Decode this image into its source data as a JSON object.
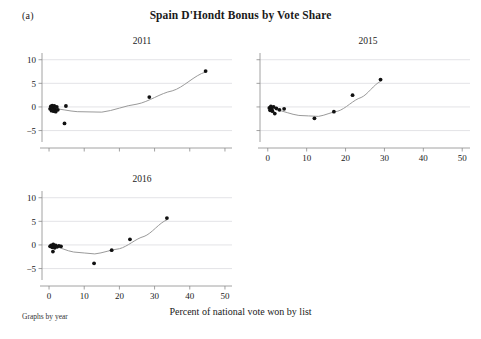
{
  "figure": {
    "letter": "(a)",
    "title": "Spain D'Hondt Bonus by Vote Share",
    "x_axis_title": "Percent of national vote won by list",
    "footnote": "Graphs by year"
  },
  "chart_data": {
    "type": "scatter",
    "title": "Spain D'Hondt Bonus by Vote Share",
    "xlabel": "Percent of national vote won by list",
    "ylabel": "",
    "xlim": [
      -2,
      52
    ],
    "ylim": [
      -7,
      11
    ],
    "grid": true,
    "legend": "none",
    "layout": "3 panels, small multiples by year (2011, 2015 top row; 2016 bottom-left)",
    "x_ticks": [
      0,
      10,
      20,
      30,
      40,
      50
    ],
    "x_tick_labels": [
      "0",
      "10",
      "20",
      "30",
      "40",
      "50"
    ],
    "y_ticks": [
      -5,
      0,
      5,
      10
    ],
    "y_tick_labels": [
      "-5",
      "0",
      "5",
      "10"
    ],
    "panels": [
      {
        "name": "2011",
        "title": "2011",
        "show_x_tick_labels": false,
        "show_y_tick_labels": true,
        "points": [
          {
            "x": 0.3,
            "y": -0.4
          },
          {
            "x": 0.5,
            "y": 0.1
          },
          {
            "x": 0.7,
            "y": -0.8
          },
          {
            "x": 0.9,
            "y": 0.3
          },
          {
            "x": 1.1,
            "y": -0.2
          },
          {
            "x": 1.3,
            "y": -0.9
          },
          {
            "x": 1.5,
            "y": 0.2
          },
          {
            "x": 1.7,
            "y": -0.5
          },
          {
            "x": 1.9,
            "y": -1.0
          },
          {
            "x": 2.2,
            "y": 0.0
          },
          {
            "x": 2.5,
            "y": -0.6
          },
          {
            "x": 4.8,
            "y": 0.2
          },
          {
            "x": 4.4,
            "y": -3.5
          },
          {
            "x": 28.5,
            "y": 2.1
          },
          {
            "x": 44.5,
            "y": 7.6
          }
        ],
        "fit_curve": {
          "type": "quadratic",
          "note": "fitted line, minimum near x=14",
          "anchors": [
            {
              "x": 1.0,
              "y": -0.3
            },
            {
              "x": 8.0,
              "y": -1.0
            },
            {
              "x": 15.0,
              "y": -1.1
            },
            {
              "x": 25.0,
              "y": 0.6
            },
            {
              "x": 35.0,
              "y": 3.4
            },
            {
              "x": 44.5,
              "y": 7.4
            }
          ]
        }
      },
      {
        "name": "2015",
        "title": "2015",
        "show_x_tick_labels": true,
        "show_y_tick_labels": false,
        "points": [
          {
            "x": 0.4,
            "y": -0.2
          },
          {
            "x": 0.6,
            "y": -0.7
          },
          {
            "x": 0.8,
            "y": 0.1
          },
          {
            "x": 1.0,
            "y": -0.5
          },
          {
            "x": 1.2,
            "y": -0.9
          },
          {
            "x": 1.5,
            "y": 0.0
          },
          {
            "x": 1.8,
            "y": -1.4
          },
          {
            "x": 2.2,
            "y": -0.3
          },
          {
            "x": 3.0,
            "y": -0.6
          },
          {
            "x": 4.2,
            "y": -0.4
          },
          {
            "x": 12.0,
            "y": -2.4
          },
          {
            "x": 17.0,
            "y": -1.0
          },
          {
            "x": 21.8,
            "y": 2.5
          },
          {
            "x": 29.0,
            "y": 5.8
          }
        ],
        "fit_curve": {
          "type": "quadratic",
          "note": "fitted line, minimum near x=12",
          "anchors": [
            {
              "x": 2.0,
              "y": -0.6
            },
            {
              "x": 8.0,
              "y": -1.8
            },
            {
              "x": 13.0,
              "y": -2.0
            },
            {
              "x": 18.0,
              "y": -0.9
            },
            {
              "x": 24.0,
              "y": 2.0
            },
            {
              "x": 29.0,
              "y": 5.4
            }
          ]
        }
      },
      {
        "name": "2016",
        "title": "2016",
        "show_x_tick_labels": true,
        "show_y_tick_labels": true,
        "points": [
          {
            "x": 0.3,
            "y": -0.3
          },
          {
            "x": 0.6,
            "y": -0.1
          },
          {
            "x": 0.9,
            "y": -0.5
          },
          {
            "x": 1.2,
            "y": 0.1
          },
          {
            "x": 1.4,
            "y": -0.2
          },
          {
            "x": 1.6,
            "y": -0.6
          },
          {
            "x": 1.9,
            "y": -0.1
          },
          {
            "x": 2.3,
            "y": -0.4
          },
          {
            "x": 2.8,
            "y": -0.2
          },
          {
            "x": 3.4,
            "y": -0.3
          },
          {
            "x": 1.1,
            "y": -1.4
          },
          {
            "x": 12.8,
            "y": -3.9
          },
          {
            "x": 17.8,
            "y": -1.1
          },
          {
            "x": 23.0,
            "y": 1.2
          },
          {
            "x": 33.5,
            "y": 5.7
          }
        ],
        "fit_curve": {
          "type": "quadratic",
          "note": "fitted line, minimum near x=13",
          "anchors": [
            {
              "x": 1.0,
              "y": -0.2
            },
            {
              "x": 7.0,
              "y": -1.5
            },
            {
              "x": 13.0,
              "y": -1.9
            },
            {
              "x": 20.0,
              "y": -0.8
            },
            {
              "x": 27.0,
              "y": 1.8
            },
            {
              "x": 33.5,
              "y": 5.3
            }
          ]
        }
      }
    ]
  }
}
